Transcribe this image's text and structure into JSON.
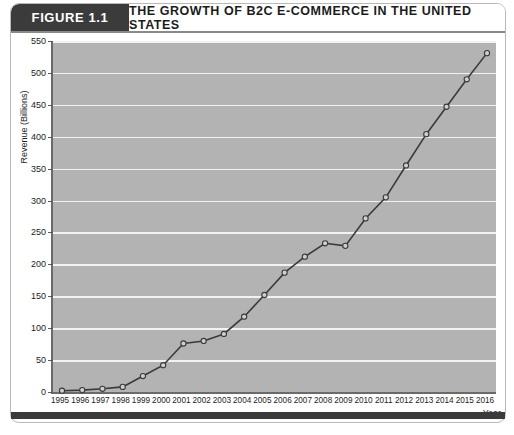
{
  "header": {
    "figure_tag": "FIGURE 1.1",
    "title": "THE GROWTH OF B2C E-COMMERCE IN THE UNITED STATES"
  },
  "colors": {
    "header_tag_bg": "#3b3b3b",
    "plot_bg": "#b3b3b3",
    "gridline": "#f2f2f2",
    "line": "#3a3a3a",
    "marker_fill": "#cfcfcf",
    "axis": "#6a6a6a"
  },
  "chart_data": {
    "type": "line",
    "title": "THE GROWTH OF B2C E-COMMERCE IN THE UNITED STATES",
    "xlabel": "Year",
    "ylabel": "Revenue (Billions)",
    "grid": true,
    "legend": "none",
    "xlim": [
      1995,
      2016
    ],
    "ylim": [
      0,
      550
    ],
    "yticks": [
      0,
      50,
      100,
      150,
      200,
      250,
      300,
      350,
      400,
      450,
      500,
      550
    ],
    "ytick_labels": [
      "0",
      "50",
      "100",
      "150",
      "200",
      "250",
      "300",
      "350",
      "400",
      "450",
      "500",
      "550"
    ],
    "categories": [
      "1995",
      "1996",
      "1997",
      "1998",
      "1999",
      "2000",
      "2001",
      "2002",
      "2003",
      "2004",
      "2005",
      "2006",
      "2007",
      "2008",
      "2009",
      "2010",
      "2011",
      "2012",
      "2013",
      "2014",
      "2015",
      "2016"
    ],
    "x": [
      1995,
      1996,
      1997,
      1998,
      1999,
      2000,
      2001,
      2002,
      2003,
      2004,
      2005,
      2006,
      2007,
      2008,
      2009,
      2010,
      2011,
      2012,
      2013,
      2014,
      2015,
      2016
    ],
    "values": [
      2,
      3,
      5,
      8,
      25,
      42,
      76,
      80,
      91,
      118,
      152,
      187,
      212,
      233,
      229,
      272,
      305,
      355,
      404,
      447,
      490,
      531
    ],
    "marker": "open-circle"
  }
}
